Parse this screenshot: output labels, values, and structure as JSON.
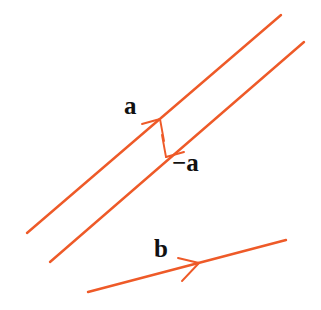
{
  "figure": {
    "background_color": "#ffffff",
    "line_color": "#ee5a28",
    "label_color": "#111111",
    "width": 321,
    "height": 310
  },
  "labels": {
    "a": "a",
    "neg_a": "−a",
    "b": "b"
  },
  "chart_data": {
    "type": "diagram",
    "xlabel": "",
    "ylabel": "",
    "grid": false,
    "legend": "none",
    "xlim": [
      0,
      321
    ],
    "ylim": [
      0,
      310
    ],
    "line_color": "#ee5a28",
    "label_color": "#111111",
    "lines": [
      {
        "name": "upper-line",
        "x1": 27,
        "y1": 233,
        "x2": 281,
        "y2": 15,
        "stroke_width": 2.4,
        "arrow": {
          "label": "a",
          "direction": "up-right",
          "tip_x": 160,
          "tip_y": 119
        }
      },
      {
        "name": "lower-line",
        "x1": 50,
        "y1": 262,
        "x2": 304,
        "y2": 42,
        "stroke_width": 2.4,
        "arrow": {
          "label": "−a",
          "direction": "down-left",
          "tip_x": 166,
          "tip_y": 157
        }
      },
      {
        "name": "b-line",
        "x1": 88,
        "y1": 292,
        "x2": 286,
        "y2": 240,
        "stroke_width": 2.4,
        "arrow": {
          "label": "b",
          "direction": "right",
          "tip_x": 199,
          "tip_y": 263
        }
      }
    ]
  }
}
